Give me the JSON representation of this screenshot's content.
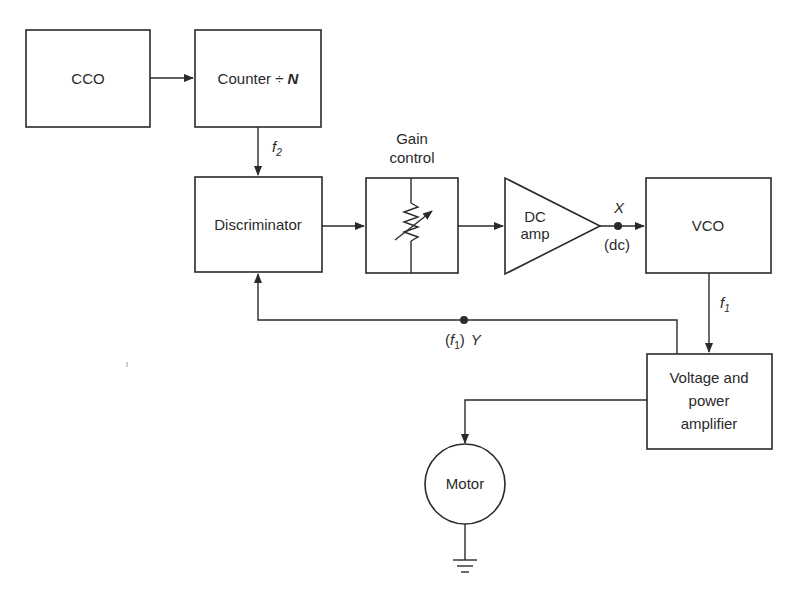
{
  "diagram": {
    "blocks": {
      "cco": {
        "label": "CCO"
      },
      "counter": {
        "label": "Counter ÷ ",
        "divisor": "N"
      },
      "discriminator": {
        "label": "Discriminator"
      },
      "gain_control": {
        "label_line1": "Gain",
        "label_line2": "control"
      },
      "dc_amp": {
        "label_line1": "DC",
        "label_line2": "amp"
      },
      "vco": {
        "label": "VCO"
      },
      "power_amp": {
        "label_line1": "Voltage and",
        "label_line2": "power",
        "label_line3": "amplifier"
      },
      "motor": {
        "label": "Motor"
      }
    },
    "signals": {
      "f2": {
        "symbol": "f",
        "subscript": "2"
      },
      "f1": {
        "symbol": "f",
        "subscript": "1"
      },
      "x_point": {
        "name": "X",
        "note": "(dc)"
      },
      "y_point": {
        "prefix": "(",
        "symbol": "f",
        "subscript": "1",
        "suffix": ")",
        "name": "Y"
      }
    },
    "colors": {
      "line": "#2a2a2a",
      "background": "#ffffff"
    }
  }
}
